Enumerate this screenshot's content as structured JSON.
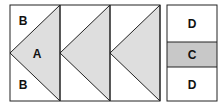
{
  "diagram": {
    "flying_geese": {
      "units": 3,
      "labels": {
        "background_top": "B",
        "goose": "A",
        "background_bottom": "B"
      }
    },
    "side_block": {
      "labels": {
        "top": "D",
        "middle": "C",
        "bottom": "D"
      }
    },
    "colors": {
      "goose_fill": "#dedede",
      "middle_fill": "#c8c8c8",
      "background": "#ffffff",
      "stroke": "#222222"
    }
  }
}
